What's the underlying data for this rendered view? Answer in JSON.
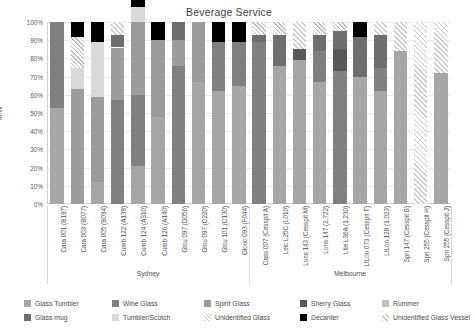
{
  "chart": {
    "title": "Beverage Service",
    "ylabel": "MNV",
    "y_ticks": [
      "100%",
      "90%",
      "80%",
      "70%",
      "60%",
      "50%",
      "40%",
      "30%",
      "20%",
      "10%",
      "0%"
    ],
    "groups": [
      {
        "label": "Sydney",
        "start": 0,
        "end": 9
      },
      {
        "label": "Melbourne",
        "start": 10,
        "end": 19
      }
    ]
  },
  "legend": {
    "items": [
      {
        "label": "Glass Tumbler",
        "key": "glass_tumbler",
        "color": "#a6a6a6",
        "pattern": "solid"
      },
      {
        "label": "Wine Glass",
        "key": "wine_glass",
        "color": "#808080",
        "pattern": "solid"
      },
      {
        "label": "Spirit Glass",
        "key": "spirit_glass",
        "color": "#9c9c9c",
        "pattern": "solid"
      },
      {
        "label": "Sherry Glass",
        "key": "sherry_glass",
        "color": "#595959",
        "pattern": "solid"
      },
      {
        "label": "Rummer",
        "key": "rummer",
        "color": "#bfbfbf",
        "pattern": "solid"
      },
      {
        "label": "Glass mug",
        "key": "glass_mug",
        "color": "#6e6e6e",
        "pattern": "solid"
      },
      {
        "label": "Tumbler/Scotch",
        "key": "tumbler_scotch",
        "color": "#d9d9d9",
        "pattern": "solid"
      },
      {
        "label": "Unidentified Glass",
        "key": "unidentified_glass",
        "color": "#bdbdbd",
        "pattern": "hatch-a"
      },
      {
        "label": "Decanter",
        "key": "decanter",
        "color": "#000000",
        "pattern": "solid"
      },
      {
        "label": "Unidentified Glass Vessel",
        "key": "unidentified_glass_vessel",
        "color": "#c9c9c9",
        "pattern": "hatch-b"
      }
    ]
  },
  "chart_data": {
    "type": "bar",
    "subtype": "stacked-percent",
    "title": "Beverage Service",
    "xlabel": "",
    "ylabel": "MNV",
    "ylim": [
      0,
      100
    ],
    "grid": true,
    "legend_position": "bottom",
    "categories": [
      "Cara 001 (B197)",
      "Cara 003 (B077)",
      "Cara 005 (B094)",
      "Cumb 122 (A138)",
      "Cumb 124 (A310)",
      "Cumb 126 (A140)",
      "Glou 097 (D056)",
      "Glou 097 (C220)",
      "Glou 101 (C130)",
      "Glouc 093 (F044)",
      "Cass 007 (Cesspit A)",
      "Leic L25C (L010)",
      "Lons 143 (Cesspit M)",
      "Lons 147 (2.722)",
      "Ltle L36A (1.230)",
      "LtLon 073 (Cesspit T)",
      "LtLon 128 (1.023)",
      "Spri 147 (Cesspit B)",
      "Spri 255 (Cesspit H)",
      "Spri 255 (Cesspit J)"
    ],
    "series": [
      {
        "name": "Glass Tumbler",
        "values": [
          53,
          0,
          12,
          0,
          21,
          48,
          0,
          67,
          62,
          65,
          0,
          76,
          79,
          67,
          0,
          70,
          62,
          84,
          0,
          72
        ]
      },
      {
        "name": "Wine Glass",
        "values": [
          47,
          0,
          0,
          57,
          39,
          0,
          76,
          0,
          27,
          24,
          89,
          0,
          0,
          17,
          73,
          0,
          13,
          0,
          0,
          0
        ]
      },
      {
        "name": "Spirit Glass",
        "values": [
          0,
          63,
          47,
          29,
          40,
          42,
          14,
          33,
          0,
          0,
          0,
          0,
          0,
          0,
          0,
          0,
          0,
          0,
          0,
          0
        ]
      },
      {
        "name": "Sherry Glass",
        "values": [
          0,
          0,
          0,
          0,
          0,
          0,
          0,
          0,
          0,
          0,
          0,
          0,
          6,
          0,
          12,
          0,
          0,
          0,
          0,
          0
        ]
      },
      {
        "name": "Rummer",
        "values": [
          0,
          0,
          0,
          0,
          0,
          0,
          0,
          0,
          0,
          0,
          0,
          0,
          0,
          0,
          0,
          0,
          0,
          0,
          0,
          0
        ]
      },
      {
        "name": "Glass mug",
        "values": [
          0,
          0,
          0,
          7,
          0,
          0,
          10,
          0,
          0,
          0,
          4,
          17,
          0,
          9,
          10,
          22,
          18,
          0,
          0,
          0
        ]
      },
      {
        "name": "Tumbler/Scotch",
        "values": [
          0,
          12,
          30,
          0,
          8,
          0,
          0,
          0,
          0,
          0,
          0,
          0,
          0,
          0,
          0,
          0,
          0,
          0,
          0,
          0
        ]
      },
      {
        "name": "Unidentified Glass",
        "values": [
          0,
          17,
          0,
          0,
          0,
          0,
          0,
          0,
          0,
          0,
          7,
          7,
          0,
          7,
          5,
          0,
          0,
          0,
          0,
          0
        ]
      },
      {
        "name": "Decanter",
        "values": [
          0,
          8,
          11,
          0,
          31,
          10,
          0,
          0,
          11,
          11,
          0,
          0,
          0,
          0,
          0,
          8,
          0,
          0,
          0,
          0
        ]
      },
      {
        "name": "Unidentified Glass Vessel",
        "values": [
          0,
          0,
          0,
          7,
          0,
          0,
          0,
          0,
          0,
          0,
          0,
          0,
          15,
          0,
          0,
          0,
          7,
          16,
          100,
          28
        ]
      }
    ]
  }
}
